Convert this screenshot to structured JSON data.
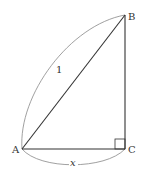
{
  "diagram": {
    "type": "right-triangle",
    "points": {
      "A": {
        "label": "A",
        "x": 22,
        "y": 149
      },
      "B": {
        "label": "B",
        "x": 125,
        "y": 15
      },
      "C": {
        "label": "C",
        "x": 125,
        "y": 149
      }
    },
    "hypotenuse_label": "1",
    "base_label": "x",
    "right_angle_at": "C",
    "colors": {
      "stroke": "#333333",
      "arc": "#777777"
    }
  }
}
